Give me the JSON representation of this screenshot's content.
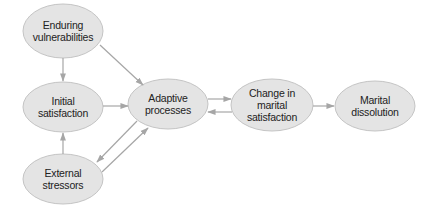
{
  "diagram": {
    "type": "flow",
    "colors": {
      "node_fill": "#e4e4e4",
      "node_stroke": "#c4c4c4",
      "edge": "#a6a6a6",
      "text": "#222222"
    },
    "nodes": [
      {
        "id": "enduring",
        "label": "Enduring\nvulnerabilities",
        "cx": 63,
        "cy": 31,
        "rx": 40,
        "ry": 27
      },
      {
        "id": "initial",
        "label": "Initial\nsatisfaction",
        "cx": 63,
        "cy": 107,
        "rx": 40,
        "ry": 25
      },
      {
        "id": "external",
        "label": "External\nstressors",
        "cx": 63,
        "cy": 179,
        "rx": 40,
        "ry": 25
      },
      {
        "id": "adaptive",
        "label": "Adaptive\nprocesses",
        "cx": 168,
        "cy": 104,
        "rx": 40,
        "ry": 25
      },
      {
        "id": "change",
        "label": "Change in\nmarital\nsatisfaction",
        "cx": 272,
        "cy": 105,
        "rx": 41,
        "ry": 26
      },
      {
        "id": "dissolution",
        "label": "Marital\ndissolution",
        "cx": 375,
        "cy": 106,
        "rx": 40,
        "ry": 25
      }
    ],
    "edges": [
      {
        "from": "enduring",
        "to": "initial"
      },
      {
        "from": "enduring",
        "to": "adaptive"
      },
      {
        "from": "initial",
        "to": "adaptive"
      },
      {
        "from": "external",
        "to": "initial"
      },
      {
        "from": "adaptive",
        "to": "external"
      },
      {
        "from": "external",
        "to": "adaptive"
      },
      {
        "from": "adaptive",
        "to": "change"
      },
      {
        "from": "change",
        "to": "adaptive"
      },
      {
        "from": "change",
        "to": "dissolution"
      }
    ]
  }
}
